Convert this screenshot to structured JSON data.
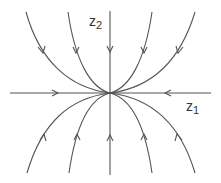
{
  "diagram": {
    "type": "phase-portrait",
    "axes": {
      "x_label": {
        "base": "z",
        "sub": "1"
      },
      "y_label": {
        "base": "z",
        "sub": "2"
      }
    },
    "colors": {
      "stroke": "#555555",
      "background": "#ffffff",
      "text": "#333333"
    },
    "origin": [
      110,
      93
    ],
    "horizontal_axis": {
      "x1": 10,
      "x2": 211,
      "arrows": [
        {
          "at": 58,
          "dir": "right"
        },
        {
          "at": 165,
          "dir": "left"
        }
      ]
    },
    "vertical_axis": {
      "y1": 11,
      "y2": 175,
      "arrows": [
        {
          "at": 52,
          "dir": "down"
        },
        {
          "at": 135,
          "dir": "up"
        }
      ]
    },
    "trajectories": [
      {
        "name": "upper-left-outer",
        "path": "M26,12 C40,62 70,88 110,93",
        "arrow_at": [
          42,
          52
        ],
        "dir": "in"
      },
      {
        "name": "upper-left-inner",
        "path": "M68,12 C75,60 90,88 110,93",
        "arrow_at": [
          76,
          52
        ],
        "dir": "in"
      },
      {
        "name": "upper-right-inner",
        "path": "M152,12 C145,60 130,88 110,93",
        "arrow_at": [
          144,
          52
        ],
        "dir": "in"
      },
      {
        "name": "upper-right-outer",
        "path": "M195,12 C180,62 150,88 110,93",
        "arrow_at": [
          179,
          52
        ],
        "dir": "in"
      },
      {
        "name": "lower-left-outer",
        "path": "M27,173 C42,122 70,98 110,93",
        "arrow_at": [
          43,
          134
        ],
        "dir": "in"
      },
      {
        "name": "lower-left-inner",
        "path": "M69,173 C76,124 90,98 110,93",
        "arrow_at": [
          77,
          134
        ],
        "dir": "in"
      },
      {
        "name": "lower-right-inner",
        "path": "M152,173 C145,124 130,98 110,93",
        "arrow_at": [
          144,
          134
        ],
        "dir": "in"
      },
      {
        "name": "lower-right-outer",
        "path": "M195,173 C180,122 150,98 110,93",
        "arrow_at": [
          179,
          134
        ],
        "dir": "in"
      }
    ]
  }
}
